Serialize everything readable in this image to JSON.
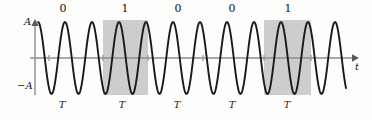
{
  "figure": {
    "type": "waveform-diagram",
    "name": "binary-amplitude-modulated-sine-wave",
    "background_color": "#fdfdfb",
    "wave_color": "#1a1a1a",
    "axis_color": "#8c8c8c",
    "shade_color": "#cdcdcd"
  },
  "axes": {
    "vertical_top_label": "A",
    "vertical_bottom_label": "−A",
    "horizontal_label": "t",
    "axis_y": 58,
    "axis_x_start": 30,
    "axis_x_end": 356
  },
  "bit_labels": [
    {
      "text": "0",
      "x": 63
    },
    {
      "text": "1",
      "x": 125
    },
    {
      "text": "0",
      "x": 178
    },
    {
      "text": "0",
      "x": 232
    },
    {
      "text": "1",
      "x": 288
    }
  ],
  "period_labels": [
    {
      "text": "T",
      "x": 62
    },
    {
      "text": "T",
      "x": 122
    },
    {
      "text": "T",
      "x": 177
    },
    {
      "text": "T",
      "x": 232
    },
    {
      "text": "T",
      "x": 287
    }
  ],
  "shaded_intervals": [
    {
      "label": "1",
      "x_start": 103,
      "x_end": 148,
      "y_top": 20,
      "y_bottom": 95
    },
    {
      "label": "1",
      "x_start": 264,
      "x_end": 311,
      "y_top": 20,
      "y_bottom": 95
    }
  ],
  "chart_data": {
    "type": "line",
    "title": "",
    "xlabel": "t",
    "ylabel": "A",
    "ylim": [
      -1,
      1
    ],
    "ytick_labels": [
      "A",
      "−A"
    ],
    "grid": false,
    "legend": null,
    "series": [
      {
        "name": "carrier-sine-wave",
        "description": "sinusoid of amplitude A and period T",
        "amplitude": 1,
        "period_px": 27,
        "phase": "cosine",
        "x_start_px": 38,
        "x_end_px": 346
      }
    ],
    "annotations": {
      "bit_sequence": [
        "0",
        "1",
        "0",
        "0",
        "1"
      ],
      "period_markers": [
        "T",
        "T",
        "T",
        "T",
        "T"
      ],
      "shaded_bits": [
        "1",
        "1"
      ]
    }
  }
}
